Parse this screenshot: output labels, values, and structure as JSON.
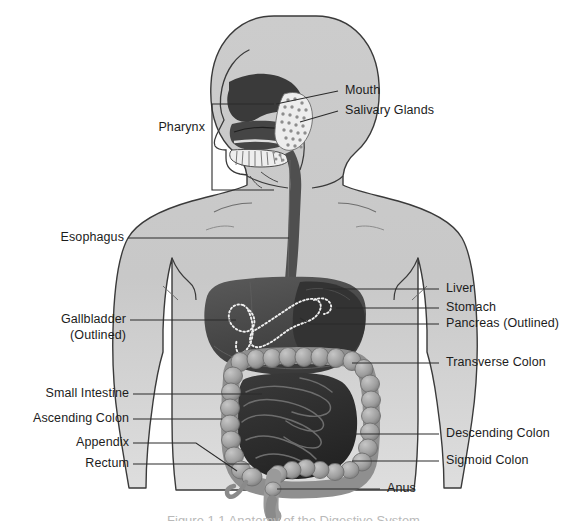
{
  "figure": {
    "caption": "Figure 1.1 Anatomy of the Digestive System",
    "background_color": "#ffffff",
    "leader_line_color": "#2b2b2b",
    "text_color": "#1c1c1c",
    "body_fill": "#c9c9c9",
    "body_outline": "#3a3a3a",
    "liver_fill": "#4a4a4a",
    "stomach_fill": "#3d3d3d",
    "cavity_fill": "#3a3a3a",
    "esophagus_fill": "#4f4f4f",
    "large_intestine_fill": "#9a9a9a",
    "small_intestine_fill": "#2e2e2e",
    "outline_dots_color": "#f2f2f2"
  },
  "labels": {
    "mouth": "Mouth",
    "salivary_glands": "Salivary Glands",
    "pharynx": "Pharynx",
    "esophagus": "Esophagus",
    "liver": "Liver",
    "stomach": "Stomach",
    "pancreas": "Pancreas (Outlined)",
    "gallbladder_line1": "Gallbladder",
    "gallbladder_line2": "(Outlined)",
    "transverse_colon": "Transverse Colon",
    "small_intestine": "Small Intestine",
    "ascending_colon": "Ascending Colon",
    "appendix": "Appendix",
    "rectum": "Rectum",
    "descending_colon": "Descending Colon",
    "sigmoid_colon": "Sigmoid Colon",
    "anus": "Anus"
  },
  "label_list": [
    {
      "key": "mouth",
      "text": "Mouth",
      "side": "right"
    },
    {
      "key": "salivary_glands",
      "text": "Salivary Glands",
      "side": "right"
    },
    {
      "key": "pharynx",
      "text": "Pharynx",
      "side": "left"
    },
    {
      "key": "esophagus",
      "text": "Esophagus",
      "side": "left"
    },
    {
      "key": "liver",
      "text": "Liver",
      "side": "right"
    },
    {
      "key": "stomach",
      "text": "Stomach",
      "side": "right"
    },
    {
      "key": "pancreas",
      "text": "Pancreas (Outlined)",
      "side": "right"
    },
    {
      "key": "gallbladder",
      "text": "Gallbladder (Outlined)",
      "side": "left"
    },
    {
      "key": "transverse_colon",
      "text": "Transverse Colon",
      "side": "right"
    },
    {
      "key": "small_intestine",
      "text": "Small Intestine",
      "side": "left"
    },
    {
      "key": "ascending_colon",
      "text": "Ascending Colon",
      "side": "left"
    },
    {
      "key": "appendix",
      "text": "Appendix",
      "side": "left"
    },
    {
      "key": "rectum",
      "text": "Rectum",
      "side": "left"
    },
    {
      "key": "descending_colon",
      "text": "Descending Colon",
      "side": "right"
    },
    {
      "key": "sigmoid_colon",
      "text": "Sigmoid Colon",
      "side": "right"
    },
    {
      "key": "anus",
      "text": "Anus",
      "side": "right"
    }
  ]
}
